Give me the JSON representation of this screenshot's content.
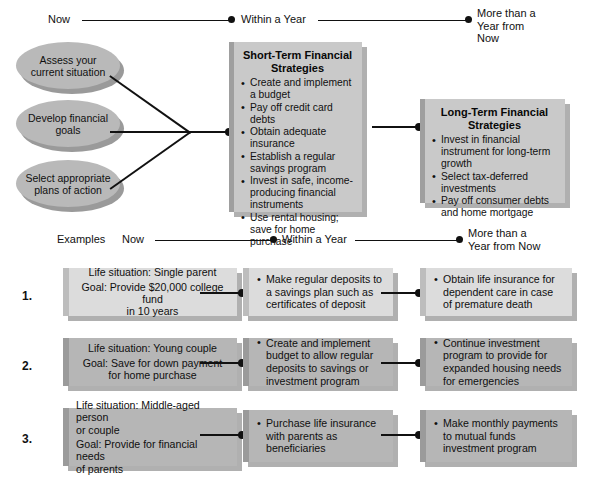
{
  "timeline_top": {
    "now": "Now",
    "within_year": "Within a Year",
    "more_than_year": "More than a\nYear from\nNow"
  },
  "timeline_examples": {
    "examples_label": "Examples",
    "now": "Now",
    "within_year": "Within a Year",
    "more_than_year": "More than a\nYear from Now"
  },
  "steps": [
    {
      "label": "Assess your\ncurrent situation"
    },
    {
      "label": "Develop financial\ngoals"
    },
    {
      "label": "Select appropriate\nplans of action"
    }
  ],
  "short_term": {
    "title": "Short-Term Financial\nStrategies",
    "items": [
      "Create and implement a budget",
      "Pay off credit card debts",
      "Obtain adequate insurance",
      "Establish a regular savings program",
      "Invest in safe, income-producing financial instruments",
      "Use rental housing; save for home purchase"
    ]
  },
  "long_term": {
    "title": "Long-Term Financial\nStrategies",
    "items": [
      "Invest in financial instrument for long-term growth",
      "Select tax-deferred investments",
      "Pay off consumer debts and home mortgage"
    ]
  },
  "examples": [
    {
      "number": "1.",
      "tone": "light",
      "life_situation": "Life situation: Single parent",
      "goal_line1": "Goal: Provide $20,000 college fund",
      "goal_line2": "in 10 years",
      "short_term_action": "Make regular deposits to a savings plan such as certificates of deposit",
      "long_term_action": "Obtain life insurance for dependent care in case of premature death"
    },
    {
      "number": "2.",
      "tone": "dark",
      "life_situation": "Life situation: Young couple",
      "goal_line1": "Goal: Save for down payment",
      "goal_line2": "for home purchase",
      "short_term_action": "Create and implement budget to allow regular deposits to savings or investment program",
      "long_term_action": "Continue investment program to provide for expanded housing needs for emergencies"
    },
    {
      "number": "3.",
      "tone": "dark",
      "life_situation": "Life situation: Middle-aged person",
      "life_situation_line2": "or couple",
      "goal_line1": "Goal: Provide for financial needs",
      "goal_line2": "of parents",
      "short_term_action": "Purchase life insurance with parents as beneficiaries",
      "long_term_action": "Make monthly payments to mutual funds investment program"
    }
  ],
  "colors": {
    "line": "#111111",
    "box_face": "#c9c9c9",
    "box_edge": "#9f9f9f",
    "box_shadow": "#b0b0b0",
    "ellipse_face": "#b9b9b9",
    "ellipse_shadow": "#9a9a9a",
    "example_light": "#dcdcdc",
    "example_dark": "#b6b6b6"
  }
}
